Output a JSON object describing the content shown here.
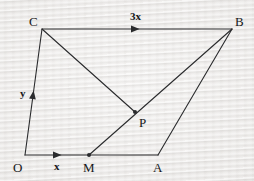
{
  "figure": {
    "canvas": {
      "width": 254,
      "height": 181
    },
    "colors": {
      "background": "#e9e7e5",
      "stroke": "#2a2b2d",
      "label": "#17181a"
    },
    "stroke_width": 1.1,
    "vertices": [
      {
        "id": "O",
        "label": "O",
        "x": 25,
        "y": 155,
        "label_x": 13,
        "label_y": 161,
        "dot": false
      },
      {
        "id": "C",
        "label": "C",
        "x": 42,
        "y": 29,
        "label_x": 29,
        "label_y": 15,
        "dot": false
      },
      {
        "id": "B",
        "label": "B",
        "x": 232,
        "y": 29,
        "label_x": 235,
        "label_y": 15,
        "dot": false
      },
      {
        "id": "A",
        "label": "A",
        "x": 158,
        "y": 155,
        "label_x": 153,
        "label_y": 161,
        "dot": false
      },
      {
        "id": "M",
        "label": "M",
        "x": 89,
        "y": 155,
        "label_x": 83,
        "label_y": 161,
        "dot": true
      },
      {
        "id": "P",
        "label": "P",
        "x": 135,
        "y": 112,
        "label_x": 139,
        "label_y": 116,
        "dot": true
      }
    ],
    "segments": [
      {
        "id": "OC",
        "from": "O",
        "to": "C",
        "name": "segment-o-c"
      },
      {
        "id": "CB",
        "from": "C",
        "to": "B",
        "name": "segment-c-b"
      },
      {
        "id": "OA",
        "from": "O",
        "to": "A",
        "name": "segment-o-a"
      },
      {
        "id": "CP",
        "from": "C",
        "to": "P",
        "name": "segment-c-p"
      },
      {
        "id": "MB",
        "from": "M",
        "to": "B",
        "name": "segment-m-b"
      },
      {
        "id": "BA",
        "from": "B",
        "to": "A",
        "name": "segment-b-a"
      }
    ],
    "arrow_markers": [
      {
        "id": "arrow-cb",
        "x": 135,
        "y": 29,
        "angle": 0,
        "name": "arrowhead-vector-3x"
      },
      {
        "id": "arrow-om",
        "x": 57,
        "y": 155,
        "angle": 0,
        "name": "arrowhead-vector-x"
      },
      {
        "id": "arrow-oc",
        "x": 33,
        "y": 95,
        "angle": -82,
        "name": "arrowhead-vector-y"
      }
    ],
    "vector_labels": [
      {
        "id": "label-3x",
        "text": "3x",
        "x": 130,
        "y": 11,
        "name": "vector-label-3x"
      },
      {
        "id": "label-x",
        "text": "x",
        "x": 54,
        "y": 161,
        "name": "vector-label-x"
      },
      {
        "id": "label-y",
        "text": "y",
        "x": 20,
        "y": 88,
        "name": "vector-label-y"
      }
    ]
  }
}
